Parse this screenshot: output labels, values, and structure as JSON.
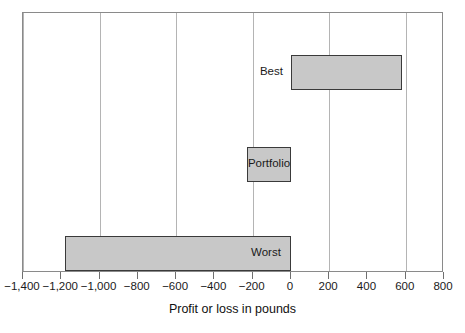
{
  "chart_data": {
    "type": "bar",
    "orientation": "horizontal",
    "title": "",
    "xlabel": "Profit or loss in pounds",
    "ylabel": "",
    "categories": [
      "Best",
      "Portfolio",
      "Worst"
    ],
    "values": [
      580,
      -230,
      -1180
    ],
    "xlim": [
      -1400,
      800
    ],
    "xticks": [
      -1400,
      -1200,
      -1000,
      -800,
      -600,
      -400,
      -200,
      0,
      200,
      400,
      600,
      800
    ],
    "xtick_labels": [
      "−1,400",
      "−1,200",
      "−1,000",
      "−800",
      "−600",
      "−400",
      "−200",
      "0",
      "200",
      "400",
      "600",
      "800"
    ],
    "gridlines_at": [
      -1400,
      -1000,
      -600,
      -200,
      200,
      600
    ],
    "grid": true,
    "legend": false,
    "bars": [
      {
        "category": "Best",
        "value": 580,
        "label_position": "outside-left"
      },
      {
        "category": "Portfolio",
        "value": -230,
        "label_position": "inside-center"
      },
      {
        "category": "Worst",
        "value": -1180,
        "label_position": "inside-right"
      }
    ],
    "colors": {
      "bar_fill": "#c8c8c8",
      "bar_stroke": "#3a3a3a",
      "frame": "#8a8a8a",
      "grid": "#b4b4b4",
      "text": "#1a1a1a",
      "background": "#ffffff"
    }
  }
}
